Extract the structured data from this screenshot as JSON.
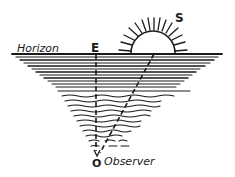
{
  "diagram": {
    "labels": {
      "horizon": "Horizon",
      "east": "E",
      "sun": "S",
      "observer_marker": "O",
      "observer": "Observer"
    },
    "colors": {
      "ink": "#1a1a1a",
      "background": "#ffffff"
    }
  }
}
